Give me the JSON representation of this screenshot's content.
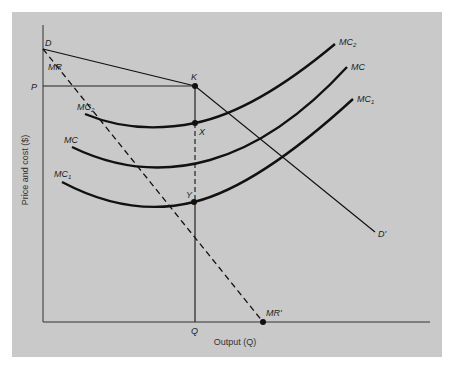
{
  "diagram": {
    "type": "monopoly cost/revenue diagram",
    "axes": {
      "y_label": "Price and cost ($)",
      "x_label": "Output (Q)",
      "y_tick_label": "P",
      "x_tick_label": "Q"
    },
    "curves": {
      "demand": {
        "start": "D",
        "end": "D'"
      },
      "marginal_revenue": {
        "start": "MR",
        "end": "MR'"
      },
      "mc2": {
        "label": "MC",
        "sub": "2"
      },
      "mc": {
        "label": "MC"
      },
      "mc1": {
        "label": "MC",
        "sub": "1"
      }
    },
    "points": {
      "k": "K",
      "x": "X",
      "y": "Y"
    },
    "colors": {
      "background": "#c9c9c9",
      "line": "#111111"
    }
  }
}
